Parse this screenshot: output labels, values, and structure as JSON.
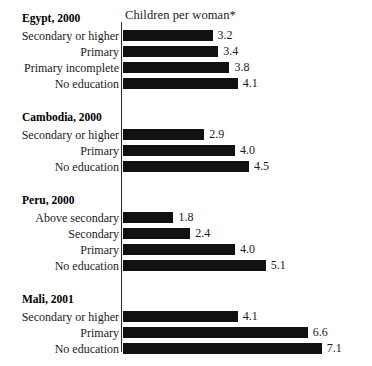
{
  "chart_data": {
    "type": "bar",
    "title": "",
    "axis_title": "Children per woman*",
    "xlabel": "Children per woman*",
    "ylabel": "",
    "orientation": "horizontal",
    "grid": false,
    "legend": "none",
    "xlim": [
      0,
      7.5
    ],
    "units_per_pixel": 0.0357,
    "bar_color": "#111111",
    "groups": [
      {
        "name": "Egypt, 2000",
        "categories": [
          "Secondary or higher",
          "Primary",
          "Primary incomplete",
          "No education"
        ],
        "values": [
          3.2,
          3.4,
          3.8,
          4.1
        ],
        "value_labels": [
          "3.2",
          "3.4",
          "3.8",
          "4.1"
        ]
      },
      {
        "name": "Cambodia, 2000",
        "categories": [
          "Secondary or higher",
          "Primary",
          "No education"
        ],
        "values": [
          2.9,
          4.0,
          4.5
        ],
        "value_labels": [
          "2.9",
          "4.0",
          "4.5"
        ]
      },
      {
        "name": "Peru, 2000",
        "categories": [
          "Above secondary",
          "Secondary",
          "Primary",
          "No education"
        ],
        "values": [
          1.8,
          2.4,
          4.0,
          5.1
        ],
        "value_labels": [
          "1.8",
          "2.4",
          "4.0",
          "5.1"
        ]
      },
      {
        "name": "Mali, 2001",
        "categories": [
          "Secondary or higher",
          "Primary",
          "No education"
        ],
        "values": [
          4.1,
          6.6,
          7.1
        ],
        "value_labels": [
          "4.1",
          "6.6",
          "7.1"
        ]
      }
    ]
  },
  "groups": [
    {
      "header": "Egypt, 2000",
      "header_y": 12,
      "rows": [
        {
          "label": "Secondary or higher",
          "value": 3.2,
          "value_label": "3.2",
          "y": 30
        },
        {
          "label": "Primary",
          "value": 3.4,
          "value_label": "3.4",
          "y": 46
        },
        {
          "label": "Primary incomplete",
          "value": 3.8,
          "value_label": "3.8",
          "y": 62
        },
        {
          "label": "No education",
          "value": 4.1,
          "value_label": "4.1",
          "y": 78
        }
      ]
    },
    {
      "header": "Cambodia, 2000",
      "header_y": 111,
      "rows": [
        {
          "label": "Secondary or higher",
          "value": 2.9,
          "value_label": "2.9",
          "y": 129
        },
        {
          "label": "Primary",
          "value": 4.0,
          "value_label": "4.0",
          "y": 145
        },
        {
          "label": "No education",
          "value": 4.5,
          "value_label": "4.5",
          "y": 161
        }
      ]
    },
    {
      "header": "Peru, 2000",
      "header_y": 194,
      "rows": [
        {
          "label": "Above secondary",
          "value": 1.8,
          "value_label": "1.8",
          "y": 212
        },
        {
          "label": "Secondary",
          "value": 2.4,
          "value_label": "2.4",
          "y": 228
        },
        {
          "label": "Primary",
          "value": 4.0,
          "value_label": "4.0",
          "y": 244
        },
        {
          "label": "No education",
          "value": 5.1,
          "value_label": "5.1",
          "y": 260
        }
      ]
    },
    {
      "header": "Mali, 2001",
      "header_y": 293,
      "rows": [
        {
          "label": "Secondary or higher",
          "value": 4.1,
          "value_label": "4.1",
          "y": 311
        },
        {
          "label": "Primary",
          "value": 6.6,
          "value_label": "6.6",
          "y": 327
        },
        {
          "label": "No education",
          "value": 7.1,
          "value_label": "7.1",
          "y": 343
        }
      ]
    }
  ],
  "axis": {
    "title": "Children per woman*"
  },
  "scale": {
    "origin_x": 123,
    "px_per_unit": 28
  }
}
